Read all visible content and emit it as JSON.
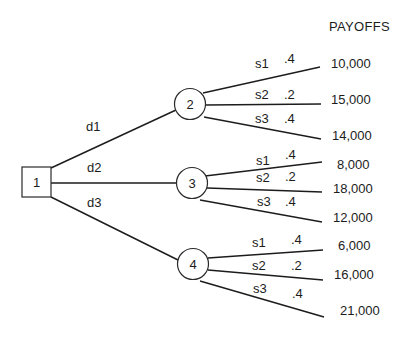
{
  "header": {
    "payoffs_label": "PAYOFFS"
  },
  "decision_node": {
    "id": "1",
    "label": "1"
  },
  "decisions": [
    {
      "label": "d1",
      "to_node": "2"
    },
    {
      "label": "d2",
      "to_node": "3"
    },
    {
      "label": "d3",
      "to_node": "4"
    }
  ],
  "chance_nodes": [
    {
      "label": "2",
      "branches": [
        {
          "state": "s1",
          "prob": ".4",
          "payoff": "10,000"
        },
        {
          "state": "s2",
          "prob": ".2",
          "payoff": "15,000"
        },
        {
          "state": "s3",
          "prob": ".4",
          "payoff": "14,000"
        }
      ]
    },
    {
      "label": "3",
      "branches": [
        {
          "state": "s1",
          "prob": ".4",
          "payoff": "8,000"
        },
        {
          "state": "s2",
          "prob": ".2",
          "payoff": "18,000"
        },
        {
          "state": "s3",
          "prob": ".4",
          "payoff": "12,000"
        }
      ]
    },
    {
      "label": "4",
      "branches": [
        {
          "state": "s1",
          "prob": ".4",
          "payoff": "6,000"
        },
        {
          "state": "s2",
          "prob": ".2",
          "payoff": "16,000"
        },
        {
          "state": "s3",
          "prob": ".4",
          "payoff": "21,000"
        }
      ]
    }
  ]
}
